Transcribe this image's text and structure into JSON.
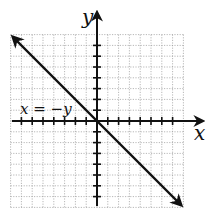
{
  "chart_data": {
    "type": "line",
    "title": "",
    "xlabel": "x",
    "ylabel": "y",
    "xlim": [
      -8,
      8
    ],
    "ylim": [
      -8,
      8
    ],
    "grid": true,
    "tick_spacing": 1,
    "series": [
      {
        "name": "x = −y",
        "equation": "x = -y",
        "x": [
          -8,
          0,
          8
        ],
        "y": [
          8,
          0,
          -8
        ],
        "arrows_both_ends": true,
        "color": "#111111"
      }
    ],
    "annotations": [
      {
        "text": "x = −y",
        "position": "left of origin, above x-axis"
      }
    ]
  },
  "labels": {
    "x_axis": "x",
    "y_axis": "y",
    "line": "x = −y"
  },
  "colors": {
    "grid": "#9a9a9a",
    "axes": "#111111",
    "line": "#111111",
    "background": "#ffffff"
  }
}
